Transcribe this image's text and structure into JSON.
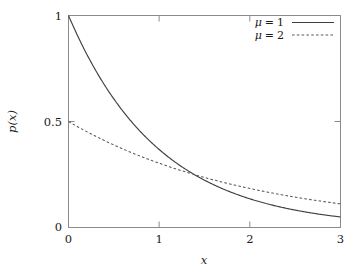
{
  "chart_data": {
    "type": "line",
    "title": "",
    "subtitle": "",
    "xlabel": "x",
    "ylabel": "p(x)",
    "xlim": [
      0,
      3
    ],
    "ylim": [
      0,
      1
    ],
    "xticks": [
      "0",
      "1",
      "2",
      "3"
    ],
    "xtick_values": [
      0,
      1,
      2,
      3
    ],
    "yticks": [
      "0",
      "0.5",
      "1"
    ],
    "ytick_values": [
      0,
      0.5,
      1
    ],
    "grid": false,
    "legend_position": "top-right",
    "legend_border": false,
    "background_color": "#ffffff",
    "axis_color": "#808080",
    "line_color": "#404040",
    "series": [
      {
        "name": "μ = 1",
        "mu": 1,
        "style": "solid",
        "formula": "p(x) = (1/μ) e^(-x/μ)",
        "x": [
          0,
          0.15,
          0.3,
          0.45,
          0.6,
          0.75,
          0.9,
          1.05,
          1.2,
          1.35,
          1.5,
          1.65,
          1.8,
          1.95,
          2.1,
          2.25,
          2.4,
          2.55,
          2.7,
          2.85,
          3.0
        ],
        "values": [
          1.0,
          0.861,
          0.741,
          0.638,
          0.549,
          0.472,
          0.407,
          0.35,
          0.301,
          0.259,
          0.223,
          0.192,
          0.165,
          0.142,
          0.122,
          0.105,
          0.091,
          0.078,
          0.067,
          0.058,
          0.05
        ]
      },
      {
        "name": "μ = 2",
        "mu": 2,
        "style": "dashed",
        "formula": "p(x) = (1/μ) e^(-x/μ)",
        "x": [
          0,
          0.15,
          0.3,
          0.45,
          0.6,
          0.75,
          0.9,
          1.05,
          1.2,
          1.35,
          1.5,
          1.65,
          1.8,
          1.95,
          2.1,
          2.25,
          2.4,
          2.55,
          2.7,
          2.85,
          3.0
        ],
        "values": [
          0.5,
          0.464,
          0.43,
          0.399,
          0.37,
          0.343,
          0.319,
          0.296,
          0.274,
          0.254,
          0.236,
          0.219,
          0.203,
          0.189,
          0.175,
          0.162,
          0.151,
          0.14,
          0.13,
          0.12,
          0.112
        ]
      }
    ],
    "intersection": {
      "x": 1.386,
      "y": 0.25
    }
  },
  "legend": {
    "entries": [
      {
        "label_prefix": "μ",
        "label_eq": "=",
        "label_value": "1",
        "style": "solid"
      },
      {
        "label_prefix": "μ",
        "label_eq": "=",
        "label_value": "2",
        "style": "dashed"
      }
    ]
  },
  "axes": {
    "x_label": "x",
    "y_label_p": "p",
    "y_label_open": "(",
    "y_label_var": "x",
    "y_label_close": ")",
    "x_tick_0": "0",
    "x_tick_1": "1",
    "x_tick_2": "2",
    "x_tick_3": "3",
    "y_tick_0": "0",
    "y_tick_half": "0.5",
    "y_tick_1": "1"
  }
}
